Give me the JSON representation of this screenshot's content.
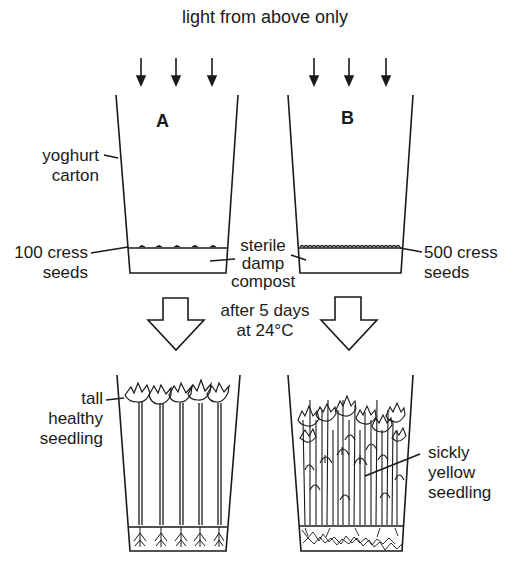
{
  "title": "light from above only",
  "setup": {
    "carton_a": {
      "label": "A",
      "seeds_label": [
        "100 cress",
        "seeds"
      ],
      "seed_count": 100
    },
    "carton_b": {
      "label": "B",
      "seeds_label": [
        "500 cress",
        "seeds"
      ],
      "seed_count": 500
    },
    "carton_label": [
      "yoghurt",
      "carton"
    ],
    "compost_label": [
      "sterile",
      "damp",
      "compost"
    ]
  },
  "condition": [
    "after 5 days",
    "at 24°C"
  ],
  "results": {
    "a_label": [
      "tall",
      "healthy",
      "seedling"
    ],
    "b_label": [
      "sickly",
      "yellow",
      "seedling"
    ]
  },
  "colors": {
    "ink": "#1a1a1a",
    "background": "#ffffff"
  }
}
